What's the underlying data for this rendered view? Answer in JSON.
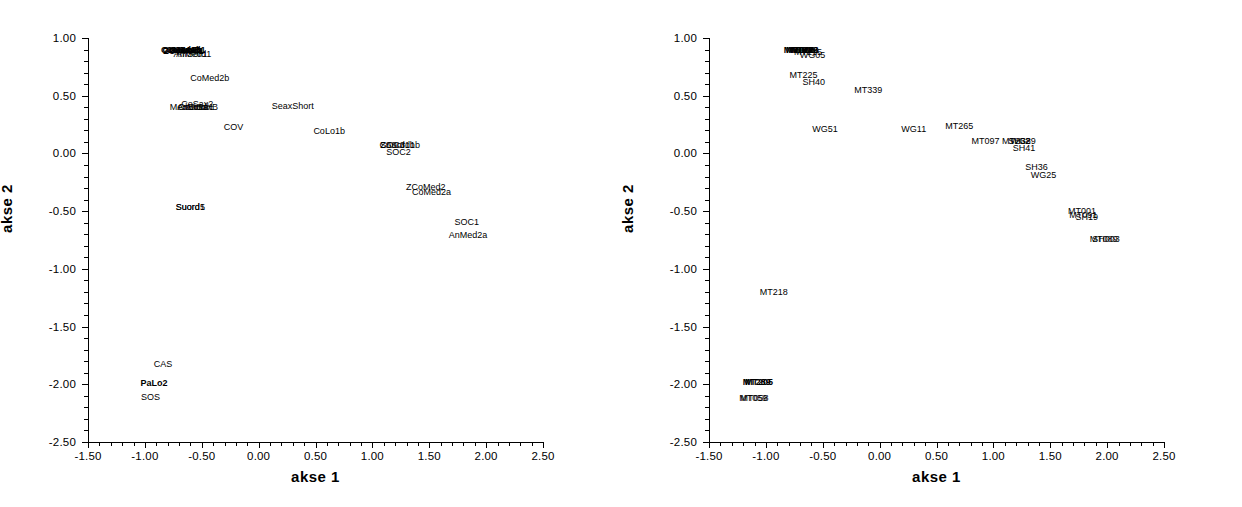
{
  "chart_data": [
    {
      "type": "scatter",
      "panel": "left",
      "title": "",
      "xlabel": "akse 1",
      "ylabel": "akse 2",
      "xlim": [
        -1.5,
        2.5
      ],
      "ylim": [
        -2.5,
        1.0
      ],
      "xticks": [
        "-1.50",
        "-1.00",
        "-0.50",
        "0.00",
        "0.50",
        "1.00",
        "1.50",
        "2.00",
        "2.50"
      ],
      "yticks": [
        "1.00",
        "0.50",
        "0.00",
        "-0.50",
        "-1.00",
        "-1.50",
        "-2.00",
        "-2.50"
      ],
      "xtick_values": [
        -1.5,
        -1.0,
        -0.5,
        0.0,
        0.5,
        1.0,
        1.5,
        2.0,
        2.5
      ],
      "ytick_values": [
        1.0,
        0.5,
        0.0,
        -0.5,
        -1.0,
        -1.5,
        -2.0,
        -2.5
      ],
      "minor_ticks_between": 4,
      "grid": false,
      "legend": "none",
      "marker": "text-label",
      "points": [
        {
          "label": "CoMed1b",
          "x": -0.68,
          "y": 0.9,
          "bold": true,
          "anchor": "c"
        },
        {
          "label": "CoSaxB",
          "x": -0.66,
          "y": 0.9,
          "bold": true,
          "anchor": "c"
        },
        {
          "label": "CoLo1a",
          "x": -0.64,
          "y": 0.9,
          "bold": true,
          "anchor": "c"
        },
        {
          "label": "AnMed1",
          "x": -0.62,
          "y": 0.9,
          "bold": true,
          "anchor": "c"
        },
        {
          "label": "CoSax1",
          "x": -0.7,
          "y": 0.9,
          "bold": true,
          "anchor": "c"
        },
        {
          "label": "ZCoMed1",
          "x": -0.66,
          "y": 0.89,
          "bold": true,
          "anchor": "c"
        },
        {
          "label": "AnMed1",
          "x": -0.6,
          "y": 0.86,
          "bold": false,
          "anchor": "c"
        },
        {
          "label": "AnSord1",
          "x": -0.57,
          "y": 0.86,
          "bold": false,
          "anchor": "c"
        },
        {
          "label": "CoMed2b",
          "x": -0.43,
          "y": 0.65,
          "bold": false,
          "anchor": "c"
        },
        {
          "label": "CoSax2",
          "x": -0.54,
          "y": 0.43,
          "bold": false,
          "anchor": "c"
        },
        {
          "label": "MedSord",
          "x": -0.62,
          "y": 0.4,
          "bold": false,
          "anchor": "c"
        },
        {
          "label": "AnLo1a",
          "x": -0.58,
          "y": 0.4,
          "bold": false,
          "anchor": "c"
        },
        {
          "label": "CoSord1",
          "x": -0.55,
          "y": 0.4,
          "bold": false,
          "anchor": "c"
        },
        {
          "label": "AnSaxB",
          "x": -0.5,
          "y": 0.4,
          "bold": false,
          "anchor": "c"
        },
        {
          "label": "SeaxShort",
          "x": 0.3,
          "y": 0.41,
          "bold": false,
          "anchor": "c"
        },
        {
          "label": "COV",
          "x": -0.22,
          "y": 0.23,
          "bold": false,
          "anchor": "c"
        },
        {
          "label": "CoLo1b",
          "x": 0.62,
          "y": 0.19,
          "bold": false,
          "anchor": "c"
        },
        {
          "label": "SOC3",
          "x": 1.18,
          "y": 0.07,
          "bold": false,
          "anchor": "c"
        },
        {
          "label": "ZSord1b",
          "x": 1.22,
          "y": 0.07,
          "bold": false,
          "anchor": "c"
        },
        {
          "label": "CoSord1b",
          "x": 1.24,
          "y": 0.07,
          "bold": false,
          "anchor": "c"
        },
        {
          "label": "SOC2",
          "x": 1.23,
          "y": 0.01,
          "bold": false,
          "anchor": "c"
        },
        {
          "label": "ZCoMed2",
          "x": 1.47,
          "y": -0.29,
          "bold": false,
          "anchor": "c"
        },
        {
          "label": "CoMed2a",
          "x": 1.52,
          "y": -0.33,
          "bold": false,
          "anchor": "c"
        },
        {
          "label": "Suord1",
          "x": -0.6,
          "y": -0.46,
          "bold": false,
          "anchor": "c"
        },
        {
          "label": "Suord5",
          "x": -0.6,
          "y": -0.46,
          "bold": false,
          "anchor": "c"
        },
        {
          "label": "SOC1",
          "x": 1.83,
          "y": -0.59,
          "bold": false,
          "anchor": "c"
        },
        {
          "label": "AnMed2a",
          "x": 1.84,
          "y": -0.71,
          "bold": false,
          "anchor": "c"
        },
        {
          "label": "CAS",
          "x": -0.84,
          "y": -1.82,
          "bold": false,
          "anchor": "c"
        },
        {
          "label": "PaLo2",
          "x": -0.92,
          "y": -1.99,
          "bold": true,
          "anchor": "c"
        },
        {
          "label": "SOS",
          "x": -0.95,
          "y": -2.11,
          "bold": false,
          "anchor": "c"
        }
      ]
    },
    {
      "type": "scatter",
      "panel": "right",
      "title": "",
      "xlabel": "akse 1",
      "ylabel": "akse 2",
      "xlim": [
        -1.5,
        2.5
      ],
      "ylim": [
        -2.5,
        1.0
      ],
      "xticks": [
        "-1.50",
        "-1.00",
        "-0.50",
        "0.00",
        "0.50",
        "1.00",
        "1.50",
        "2.00",
        "2.50"
      ],
      "yticks": [
        "1.00",
        "0.50",
        "0.00",
        "-0.50",
        "-1.00",
        "-1.50",
        "-2.00",
        "-2.50"
      ],
      "xtick_values": [
        -1.5,
        -1.0,
        -0.5,
        0.0,
        0.5,
        1.0,
        1.5,
        2.0,
        2.5
      ],
      "ytick_values": [
        1.0,
        0.5,
        0.0,
        -0.5,
        -1.0,
        -1.5,
        -2.0,
        -2.5
      ],
      "minor_ticks_between": 4,
      "grid": false,
      "legend": "none",
      "marker": "text-label",
      "points": [
        {
          "label": "MT091",
          "x": -0.72,
          "y": 0.9,
          "bold": true,
          "anchor": "c"
        },
        {
          "label": "MT060",
          "x": -0.7,
          "y": 0.9,
          "bold": true,
          "anchor": "c"
        },
        {
          "label": "WG06",
          "x": -0.68,
          "y": 0.9,
          "bold": true,
          "anchor": "c"
        },
        {
          "label": "MT223",
          "x": -0.66,
          "y": 0.9,
          "bold": true,
          "anchor": "c"
        },
        {
          "label": "SH39",
          "x": -0.64,
          "y": 0.9,
          "bold": true,
          "anchor": "c"
        },
        {
          "label": "MT215",
          "x": -0.63,
          "y": 0.88,
          "bold": false,
          "anchor": "c"
        },
        {
          "label": "WG05",
          "x": -0.59,
          "y": 0.85,
          "bold": false,
          "anchor": "c"
        },
        {
          "label": "MT225",
          "x": -0.67,
          "y": 0.68,
          "bold": false,
          "anchor": "c"
        },
        {
          "label": "SH40",
          "x": -0.58,
          "y": 0.62,
          "bold": false,
          "anchor": "c"
        },
        {
          "label": "MT339",
          "x": -0.1,
          "y": 0.55,
          "bold": false,
          "anchor": "c"
        },
        {
          "label": "WG51",
          "x": -0.48,
          "y": 0.21,
          "bold": false,
          "anchor": "c"
        },
        {
          "label": "WG11",
          "x": 0.3,
          "y": 0.21,
          "bold": false,
          "anchor": "c"
        },
        {
          "label": "MT265",
          "x": 0.7,
          "y": 0.24,
          "bold": false,
          "anchor": "c"
        },
        {
          "label": "MT097",
          "x": 0.93,
          "y": 0.11,
          "bold": false,
          "anchor": "c"
        },
        {
          "label": "MT262",
          "x": 1.2,
          "y": 0.11,
          "bold": false,
          "anchor": "c"
        },
        {
          "label": "SH38",
          "x": 1.23,
          "y": 0.11,
          "bold": false,
          "anchor": "c"
        },
        {
          "label": "WG29",
          "x": 1.26,
          "y": 0.11,
          "bold": false,
          "anchor": "c"
        },
        {
          "label": "SH41",
          "x": 1.27,
          "y": 0.05,
          "bold": false,
          "anchor": "c"
        },
        {
          "label": "SH36",
          "x": 1.38,
          "y": -0.12,
          "bold": false,
          "anchor": "c"
        },
        {
          "label": "WG25",
          "x": 1.44,
          "y": -0.19,
          "bold": false,
          "anchor": "c"
        },
        {
          "label": "MT001",
          "x": 1.78,
          "y": -0.5,
          "bold": false,
          "anchor": "c"
        },
        {
          "label": "MT091",
          "x": 1.79,
          "y": -0.53,
          "bold": false,
          "anchor": "c"
        },
        {
          "label": "SH19",
          "x": 1.82,
          "y": -0.55,
          "bold": false,
          "anchor": "c"
        },
        {
          "label": "MT089",
          "x": 1.97,
          "y": -0.74,
          "bold": false,
          "anchor": "c"
        },
        {
          "label": "SH003",
          "x": 1.99,
          "y": -0.74,
          "bold": false,
          "anchor": "c"
        },
        {
          "label": "MT218",
          "x": -0.93,
          "y": -1.2,
          "bold": false,
          "anchor": "c"
        },
        {
          "label": "MT289",
          "x": -1.08,
          "y": -1.98,
          "bold": true,
          "anchor": "c"
        },
        {
          "label": "MT205",
          "x": -1.06,
          "y": -1.98,
          "bold": true,
          "anchor": "c"
        },
        {
          "label": "MT059",
          "x": -1.11,
          "y": -2.12,
          "bold": false,
          "anchor": "c"
        },
        {
          "label": "MT058",
          "x": -1.1,
          "y": -2.12,
          "bold": false,
          "anchor": "c"
        }
      ]
    }
  ]
}
